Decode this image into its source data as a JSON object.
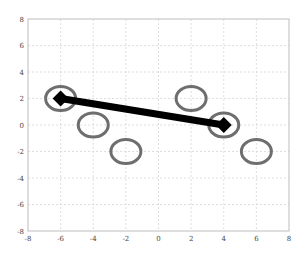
{
  "chart_data": {
    "type": "scatter",
    "title": "",
    "xlabel": "",
    "ylabel": "",
    "xlim": [
      -8,
      8
    ],
    "ylim": [
      -8,
      8
    ],
    "grid": true,
    "legend": null,
    "x_ticks": [
      "-8",
      "-6",
      "-4",
      "-2",
      "0",
      "2",
      "4",
      "6",
      "8"
    ],
    "y_ticks": [
      "8",
      "6",
      "4",
      "2",
      "0",
      "-2",
      "-4",
      "-6",
      "-8"
    ],
    "series": [
      {
        "name": "circles",
        "marker": "ellipse-outline",
        "color": "#6e6e6e",
        "points": [
          {
            "x": -6,
            "y": 2
          },
          {
            "x": -4,
            "y": 0
          },
          {
            "x": -2,
            "y": -2
          },
          {
            "x": 2,
            "y": 2
          },
          {
            "x": 4,
            "y": 0
          },
          {
            "x": 6,
            "y": -2
          }
        ]
      },
      {
        "name": "line",
        "marker": "diamond",
        "color": "#000000",
        "points": [
          {
            "x": -6,
            "y": 2
          },
          {
            "x": 4,
            "y": 0
          }
        ]
      }
    ]
  },
  "colors": {
    "axis": "#bdbdbd",
    "grid": "#d6d6d6",
    "circle": "#6e6e6e",
    "line": "#000000"
  }
}
